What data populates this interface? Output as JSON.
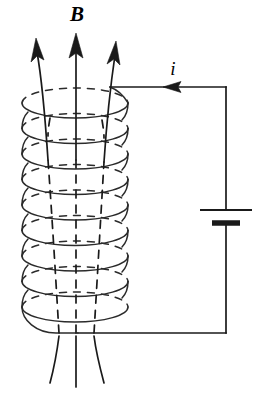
{
  "figure": {
    "name": "solenoid-magnetic-field-diagram",
    "title": "Solenoid carrying current i producing magnetic field B",
    "background_color": "#ffffff",
    "ink_color": "#1a1a1a",
    "coil_color": "#2b2b2b",
    "width": 258,
    "height": 393
  },
  "labels": {
    "magnetic_field": {
      "text": "B",
      "style": "bold-italic-serif",
      "x": 77,
      "y": 21
    },
    "current": {
      "text": "i",
      "style": "italic-serif",
      "x": 173,
      "y": 75
    }
  },
  "solenoid": {
    "name": "coil",
    "turns": 9,
    "center_x": 75,
    "radius_x": 53,
    "radius_y": 15,
    "top_y": 103,
    "turn_spacing": 25.5,
    "back_arc_dashed": true
  },
  "field_lines": {
    "count": 3,
    "description": "Three magnetic field lines running up through the solenoid axis, emerging at top as arrows pointing upward and diverging below the coil",
    "arrow_tips": [
      {
        "x": 36,
        "y": 41
      },
      {
        "x": 76,
        "y": 36
      },
      {
        "x": 114,
        "y": 44
      }
    ]
  },
  "circuit": {
    "top_wire": {
      "name": "top-lead-wire",
      "from_x": 110,
      "to_x": 226,
      "y": 87,
      "current_arrow_direction": "left",
      "current_arrow_x": 175
    },
    "right_wire": {
      "name": "right-lead-wire",
      "x": 226,
      "from_y": 87,
      "to_y": 333
    },
    "bottom_wire": {
      "name": "bottom-lead-wire",
      "from_x": 226,
      "to_x": 78,
      "y": 333
    },
    "battery": {
      "name": "battery-cell",
      "positive_plate": {
        "y": 210,
        "half_width": 26
      },
      "negative_plate": {
        "y": 223,
        "half_width": 14
      },
      "symbol": "dc-source"
    }
  }
}
